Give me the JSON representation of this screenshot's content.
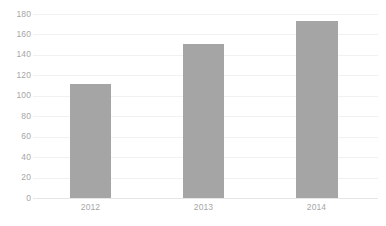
{
  "chart_data": {
    "type": "bar",
    "title": "",
    "subtitle": "",
    "xlabel": "",
    "ylabel": "",
    "categories": [
      "2012",
      "2013",
      "2014"
    ],
    "values": [
      112,
      151,
      173
    ],
    "series": [
      {
        "name": "",
        "values": [
          112,
          151,
          173
        ],
        "color": "#a5a5a5"
      }
    ],
    "ylim": [
      0,
      180
    ],
    "ytick_step": 20,
    "yticks": [
      180,
      160,
      140,
      120,
      100,
      80,
      60,
      40,
      20,
      0
    ],
    "ytick_labels": [
      "180",
      "160",
      "140",
      "120",
      "100",
      "80",
      "60",
      "40",
      "20",
      "0"
    ],
    "grid": {
      "horizontal": true,
      "vertical": false,
      "color": "#f1f1f1"
    },
    "legend": {
      "visible": false,
      "position": "none",
      "entries": []
    },
    "annotations": [],
    "data_labels_visible": false,
    "colors": {
      "bar": "#a5a5a5",
      "axis_text": "#a6a6a6",
      "gridline": "#f1f1f1",
      "baseline": "#e6e6e6",
      "background": "#ffffff"
    }
  }
}
